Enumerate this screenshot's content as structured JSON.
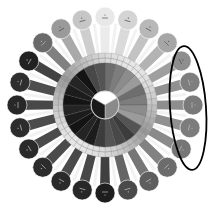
{
  "diagram": {
    "type": "radial-color-wheel",
    "center": [
      105,
      105
    ],
    "outer_circle_count": 24,
    "outer_radius": 88,
    "outer_circle_diameter": 20,
    "ring_outer_radius": 52,
    "ring_inner_radius": 42,
    "core_radius": 14,
    "outer_circles": [
      {
        "angle": -90,
        "fill": "#e8e8e8",
        "label": ""
      },
      {
        "angle": -75,
        "fill": "#d4d4d4",
        "label": ""
      },
      {
        "angle": -60,
        "fill": "#b8b8b8",
        "label": ""
      },
      {
        "angle": -45,
        "fill": "#a6a6a6",
        "label": ""
      },
      {
        "angle": -30,
        "fill": "#8e8e8e",
        "label": ""
      },
      {
        "angle": -15,
        "fill": "#7e7e7e",
        "label": ""
      },
      {
        "angle": 0,
        "fill": "#7a7a7a",
        "label": ""
      },
      {
        "angle": 15,
        "fill": "#7c7c7c",
        "label": ""
      },
      {
        "angle": 30,
        "fill": "#767676",
        "label": ""
      },
      {
        "angle": 45,
        "fill": "#6c6c6c",
        "label": ""
      },
      {
        "angle": 60,
        "fill": "#5e5e5e",
        "label": ""
      },
      {
        "angle": 75,
        "fill": "#4a4a4a",
        "label": ""
      },
      {
        "angle": 90,
        "fill": "#1e1e1e",
        "label": ""
      },
      {
        "angle": 105,
        "fill": "#282828",
        "label": ""
      },
      {
        "angle": 120,
        "fill": "#2a2a2a",
        "label": ""
      },
      {
        "angle": 135,
        "fill": "#2c2c2c",
        "label": ""
      },
      {
        "angle": 150,
        "fill": "#2a2a2a",
        "label": ""
      },
      {
        "angle": 165,
        "fill": "#2c2c2c",
        "label": ""
      },
      {
        "angle": 180,
        "fill": "#282828",
        "label": ""
      },
      {
        "angle": 195,
        "fill": "#2e2e2e",
        "label": ""
      },
      {
        "angle": 210,
        "fill": "#222222",
        "label": ""
      },
      {
        "angle": 225,
        "fill": "#6a6a6a",
        "label": ""
      },
      {
        "angle": 240,
        "fill": "#9a9a9a",
        "label": ""
      },
      {
        "angle": 255,
        "fill": "#c6c6c6",
        "label": ""
      }
    ],
    "core_segments": [
      {
        "fill": "#ffffff"
      },
      {
        "fill": "#8a8a8a"
      },
      {
        "fill": "#1a1a1a"
      }
    ],
    "annotation": {
      "shape": "ellipse",
      "stroke": "#000000",
      "cx": 188,
      "cy": 108,
      "rx": 18,
      "ry": 62
    }
  }
}
